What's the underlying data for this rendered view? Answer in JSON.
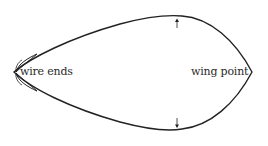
{
  "diagram": {
    "labels": {
      "left": "wire ends",
      "right": "wing point"
    },
    "colors": {
      "stroke": "#222222",
      "text": "#2a2a2a",
      "background": "#ffffff"
    },
    "arrows": [
      {
        "direction": "up",
        "x": 177,
        "y": 23
      },
      {
        "direction": "down",
        "x": 177,
        "y": 128
      }
    ]
  }
}
